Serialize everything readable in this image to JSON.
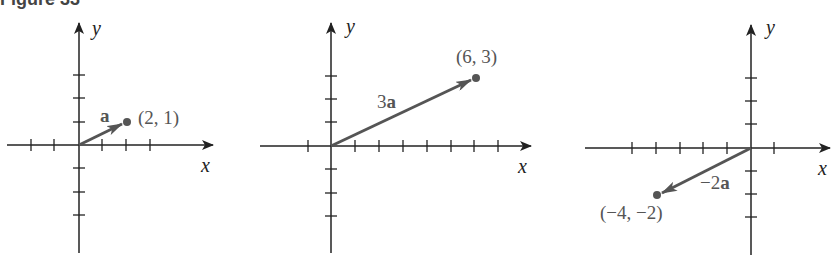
{
  "figure": {
    "caption": "Figure 33",
    "axis_color": "#222222",
    "vector_color": "#555555",
    "panels": [
      {
        "id": "panel-a",
        "x_label": "x",
        "y_label": "y",
        "vector_label": {
          "coef": "",
          "sym": "a"
        },
        "point_label": "(2, 1)",
        "vector": {
          "from": [
            0,
            0
          ],
          "to": [
            2,
            1
          ]
        }
      },
      {
        "id": "panel-3a",
        "x_label": "x",
        "y_label": "y",
        "vector_label": {
          "coef": "3",
          "sym": "a"
        },
        "point_label": "(6, 3)",
        "vector": {
          "from": [
            0,
            0
          ],
          "to": [
            6,
            3
          ]
        }
      },
      {
        "id": "panel-neg2a",
        "x_label": "x",
        "y_label": "y",
        "vector_label": {
          "coef": "−2",
          "sym": "a"
        },
        "point_label": "(−4, −2)",
        "vector": {
          "from": [
            0,
            0
          ],
          "to": [
            -4,
            -2
          ]
        }
      }
    ]
  }
}
